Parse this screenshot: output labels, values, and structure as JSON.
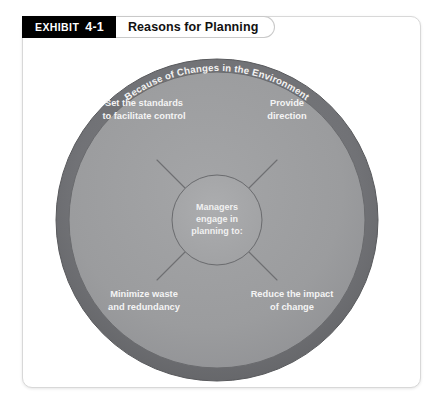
{
  "exhibit": {
    "tab_word": "EXHIBIT",
    "tab_number": "4-1",
    "title": "Reasons for Planning"
  },
  "diagram": {
    "type": "concentric-circle-diagram",
    "outer_ring_label": "Because of Changes in the Environment",
    "center": {
      "line1": "Managers",
      "line2": "engage in",
      "line3": "planning to:"
    },
    "reasons": [
      {
        "id": "set-standards",
        "position": "top-left",
        "line1": "Set the standards",
        "line2": "to facilitate control"
      },
      {
        "id": "provide-direction",
        "position": "top-right",
        "line1": "Provide",
        "line2": "direction"
      },
      {
        "id": "minimize-waste",
        "position": "bottom-left",
        "line1": "Minimize waste",
        "line2": "and redundancy"
      },
      {
        "id": "reduce-impact",
        "position": "bottom-right",
        "line1": "Reduce the impact",
        "line2": "of change"
      }
    ],
    "colors": {
      "outer_ring": "#6f7072",
      "ring_highlight": "#85868a",
      "inner_disc": "#9b9c9e",
      "core_disc": "#a3a4a6",
      "text": "#f2f2f2",
      "stroke": "#5c5d5f",
      "tab_background": "#000000",
      "tab_text": "#ffffff",
      "card_background": "#ffffff",
      "card_border": "#d8d8d8"
    }
  }
}
